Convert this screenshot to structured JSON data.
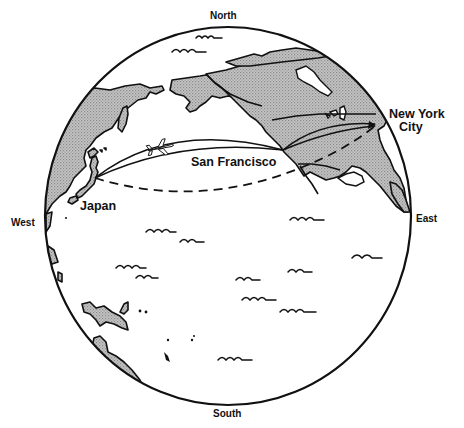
{
  "compass": {
    "north": "North",
    "south": "South",
    "east": "East",
    "west": "West"
  },
  "places": {
    "japan": "Japan",
    "san_francisco": "San Francisco",
    "new_york_line1": "New York",
    "new_york_line2": "City"
  },
  "routes": [
    {
      "from": "Japan",
      "to": "San Francisco",
      "style": "solid-double-arc",
      "icon": "airplane-icon"
    },
    {
      "from": "San Francisco",
      "to": "New York City",
      "style": "solid-double-arc"
    },
    {
      "from": "Japan",
      "to": "New York City",
      "style": "dashed"
    }
  ],
  "colors": {
    "land": "#b8b8b8",
    "outline": "#111111",
    "ocean": "#ffffff"
  }
}
